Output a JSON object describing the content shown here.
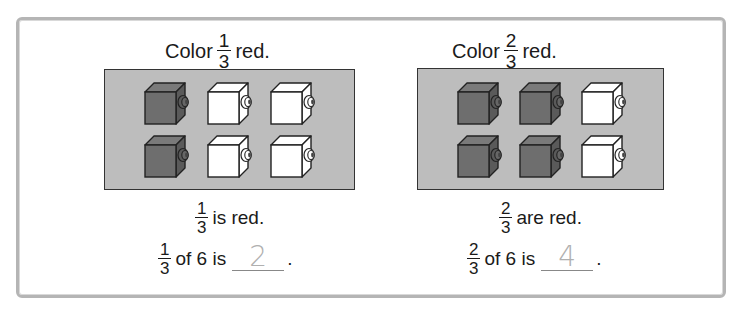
{
  "colors": {
    "frame_border": "#b5b5b5",
    "panel_bg": "#bdbdbd",
    "cube_red": "#6e6e6e",
    "cube_white": "#ffffff",
    "answer_text": "#b0b0b0"
  },
  "problems": [
    {
      "title": {
        "prefix": "Color",
        "numerator": "1",
        "denominator": "3",
        "suffix": "red."
      },
      "cubes": [
        [
          "colored",
          "white",
          "white"
        ],
        [
          "colored",
          "white",
          "white"
        ]
      ],
      "statement": {
        "numerator": "1",
        "denominator": "3",
        "text": "is red."
      },
      "question": {
        "numerator": "1",
        "denominator": "3",
        "text": "of 6 is",
        "answer": "2",
        "end": "."
      }
    },
    {
      "title": {
        "prefix": "Color",
        "numerator": "2",
        "denominator": "3",
        "suffix": "red."
      },
      "cubes": [
        [
          "colored",
          "colored",
          "white"
        ],
        [
          "colored",
          "colored",
          "white"
        ]
      ],
      "statement": {
        "numerator": "2",
        "denominator": "3",
        "text": "are red."
      },
      "question": {
        "numerator": "2",
        "denominator": "3",
        "text": "of 6 is",
        "answer": "4",
        "end": "."
      }
    }
  ]
}
